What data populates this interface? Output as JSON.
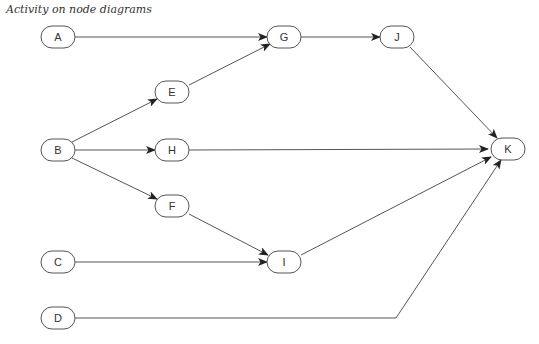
{
  "title": "Activity on node diagrams",
  "nodes": [
    {
      "id": "A",
      "label": "A",
      "x": 58,
      "y": 37
    },
    {
      "id": "G",
      "label": "G",
      "x": 284,
      "y": 37
    },
    {
      "id": "J",
      "label": "J",
      "x": 397,
      "y": 37
    },
    {
      "id": "E",
      "label": "E",
      "x": 172,
      "y": 92
    },
    {
      "id": "B",
      "label": "B",
      "x": 58,
      "y": 150
    },
    {
      "id": "H",
      "label": "H",
      "x": 172,
      "y": 150
    },
    {
      "id": "K",
      "label": "K",
      "x": 508,
      "y": 149
    },
    {
      "id": "F",
      "label": "F",
      "x": 172,
      "y": 206
    },
    {
      "id": "C",
      "label": "C",
      "x": 58,
      "y": 262
    },
    {
      "id": "I",
      "label": "I",
      "x": 284,
      "y": 262
    },
    {
      "id": "D",
      "label": "D",
      "x": 58,
      "y": 318
    }
  ],
  "edges": [
    {
      "from": "A",
      "to": "G",
      "points": [
        [
          75,
          37
        ],
        [
          267,
          37
        ]
      ]
    },
    {
      "from": "E",
      "to": "G",
      "points": [
        [
          189,
          85
        ],
        [
          270,
          44
        ]
      ]
    },
    {
      "from": "G",
      "to": "J",
      "points": [
        [
          301,
          37
        ],
        [
          380,
          37
        ]
      ]
    },
    {
      "from": "J",
      "to": "K",
      "points": [
        [
          410,
          47
        ],
        [
          497,
          138
        ]
      ]
    },
    {
      "from": "B",
      "to": "E",
      "points": [
        [
          72,
          142
        ],
        [
          157,
          99
        ]
      ]
    },
    {
      "from": "B",
      "to": "H",
      "points": [
        [
          75,
          150
        ],
        [
          155,
          150
        ]
      ]
    },
    {
      "from": "B",
      "to": "F",
      "points": [
        [
          72,
          158
        ],
        [
          157,
          199
        ]
      ]
    },
    {
      "from": "H",
      "to": "K",
      "points": [
        [
          189,
          150
        ],
        [
          488,
          149
        ]
      ]
    },
    {
      "from": "F",
      "to": "I",
      "points": [
        [
          189,
          214
        ],
        [
          268,
          255
        ]
      ]
    },
    {
      "from": "C",
      "to": "I",
      "points": [
        [
          75,
          262
        ],
        [
          267,
          262
        ]
      ]
    },
    {
      "from": "I",
      "to": "K",
      "points": [
        [
          301,
          255
        ],
        [
          491,
          157
        ]
      ]
    },
    {
      "from": "D",
      "to": "K",
      "points": [
        [
          75,
          318
        ],
        [
          396,
          318
        ],
        [
          501,
          160
        ]
      ]
    }
  ]
}
